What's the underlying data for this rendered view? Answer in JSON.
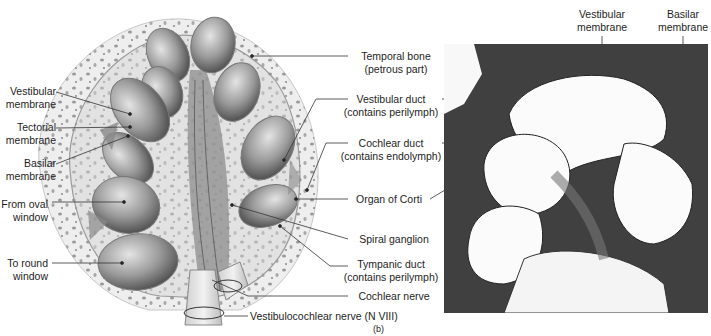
{
  "figure": {
    "panel_label": "(b)"
  },
  "left_labels": [
    {
      "id": "vestibular-membrane-left",
      "lines": [
        "Vestibular",
        "membrane"
      ]
    },
    {
      "id": "tectorial-membrane",
      "lines": [
        "Tectorial",
        "membrane"
      ]
    },
    {
      "id": "basilar-membrane-left",
      "lines": [
        "Basilar",
        "membrane"
      ]
    },
    {
      "id": "from-oval-window",
      "lines": [
        "From oval",
        "window"
      ]
    },
    {
      "id": "to-round-window",
      "lines": [
        "To round",
        "window"
      ]
    }
  ],
  "center_labels": [
    {
      "id": "temporal-bone",
      "lines": [
        "Temporal bone",
        "(petrous part)"
      ]
    },
    {
      "id": "vestibular-duct",
      "lines": [
        "Vestibular duct",
        "(contains perilymph)"
      ]
    },
    {
      "id": "cochlear-duct",
      "lines": [
        "Cochlear duct",
        "(contains endolymph)"
      ]
    },
    {
      "id": "organ-of-corti",
      "lines": [
        "Organ of Corti"
      ]
    },
    {
      "id": "spiral-ganglion",
      "lines": [
        "Spiral ganglion"
      ]
    },
    {
      "id": "tympanic-duct",
      "lines": [
        "Tympanic duct",
        "(contains perilymph)"
      ]
    },
    {
      "id": "cochlear-nerve",
      "lines": [
        "Cochlear nerve"
      ]
    }
  ],
  "bottom_label": {
    "id": "vestibulocochlear-nerve",
    "text": "Vestibulocochlear nerve (N VIII)"
  },
  "top_right_labels": [
    {
      "id": "vestibular-membrane-right",
      "lines": [
        "Vestibular",
        "membrane"
      ]
    },
    {
      "id": "basilar-membrane-right",
      "lines": [
        "Basilar",
        "membrane"
      ]
    }
  ],
  "colors": {
    "bone": "#ececec",
    "bone_spots": "#8a8a8a",
    "chamber_dark": "#5a5a5a",
    "chamber_light": "#d8d8d8",
    "micro_tissue": "#3c3c3c",
    "micro_space": "#fbfbfb",
    "leader_line": "#333333"
  }
}
